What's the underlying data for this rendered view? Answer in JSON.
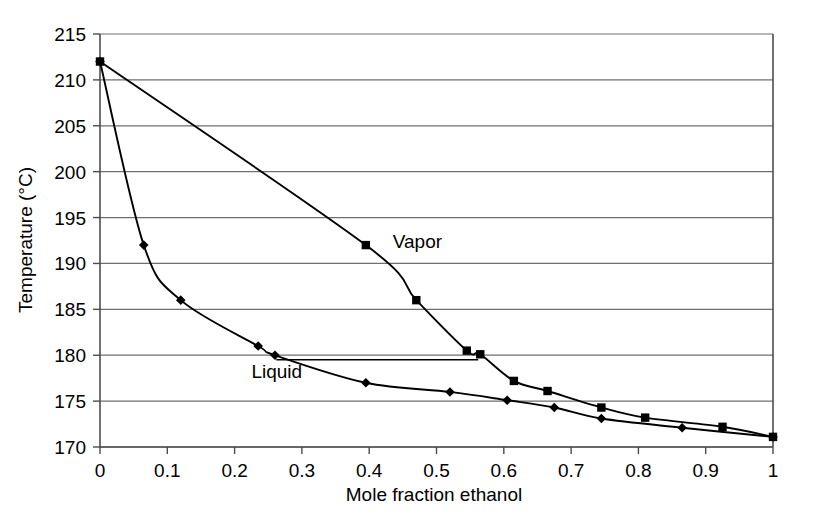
{
  "chart_data": {
    "type": "line",
    "title": "",
    "xlabel": "Mole fraction ethanol",
    "ylabel": "Temperature (°C)",
    "xlim": [
      0,
      1
    ],
    "ylim": [
      170,
      215
    ],
    "xticks": [
      "0",
      "0.1",
      "0.2",
      "0.3",
      "0.4",
      "0.5",
      "0.6",
      "0.7",
      "0.8",
      "0.9",
      "1"
    ],
    "xtick_values": [
      0,
      0.1,
      0.2,
      0.3,
      0.4,
      0.5,
      0.6,
      0.7,
      0.8,
      0.9,
      1
    ],
    "yticks": [
      "170",
      "175",
      "180",
      "185",
      "190",
      "195",
      "200",
      "205",
      "210",
      "215"
    ],
    "ytick_values": [
      170,
      175,
      180,
      185,
      190,
      195,
      200,
      205,
      210,
      215
    ],
    "grid": "horizontal",
    "legend": "inline-annotations",
    "series": [
      {
        "name": "Vapor",
        "marker": "square",
        "label_x": 0.435,
        "label_y": 192.5,
        "x": [
          0,
          0.395,
          0.47,
          0.545,
          0.565,
          0.615,
          0.665,
          0.745,
          0.81,
          0.925,
          1
        ],
        "y": [
          212,
          192,
          186,
          180.5,
          180.1,
          177.2,
          176.1,
          174.3,
          173.2,
          172.2,
          171.1
        ]
      },
      {
        "name": "Liquid",
        "marker": "diamond",
        "label_x": 0.225,
        "label_y": 178.3,
        "x": [
          0,
          0.065,
          0.12,
          0.235,
          0.26,
          0.395,
          0.52,
          0.605,
          0.675,
          0.745,
          0.865,
          1
        ],
        "y": [
          212,
          192,
          186,
          181,
          180,
          177,
          176,
          175.1,
          174.3,
          173.1,
          172.1,
          171.1
        ]
      }
    ],
    "tie_line": {
      "name": "tie-line",
      "y": 179.5,
      "x_start": 0.262,
      "x_end": 0.562
    }
  }
}
